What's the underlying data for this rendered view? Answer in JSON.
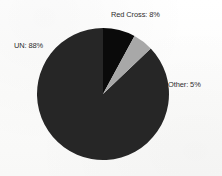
{
  "chart_data": {
    "type": "pie",
    "title": "",
    "subtitle": "",
    "xlabel": "",
    "ylabel": "",
    "grid": false,
    "legend_position": "none",
    "labels_position": "outside-callout",
    "start_angle_deg": 0,
    "direction": "clockwise",
    "categories": [
      "Red Cross",
      "Other",
      "UN"
    ],
    "values": [
      8,
      5,
      88
    ],
    "unit": "%",
    "slices": [
      {
        "name": "Red Cross",
        "value": 8,
        "label": "Red Cross: 8%",
        "color": "#0a0a0a",
        "start_angle_deg": 0,
        "end_angle_deg": 28.8
      },
      {
        "name": "Other",
        "value": 5,
        "label": "Other: 5%",
        "color": "#a8a8a8",
        "start_angle_deg": 28.8,
        "end_angle_deg": 46.8
      },
      {
        "name": "UN",
        "value": 88,
        "label": "UN: 88%",
        "color": "#262626",
        "start_angle_deg": 46.8,
        "end_angle_deg": 363.6
      }
    ]
  },
  "labels": {
    "red_cross": "Red Cross: 8%",
    "un": "UN: 88%",
    "other": "Other: 5%"
  },
  "colors": {
    "red_cross_slice": "#0a0a0a",
    "other_slice": "#a8a8a8",
    "un_slice": "#262626",
    "label_text": "#2d2d2d",
    "background": "#fdfdfc"
  },
  "geometry": {
    "center_x": 103,
    "center_y": 94,
    "radius": 66
  }
}
